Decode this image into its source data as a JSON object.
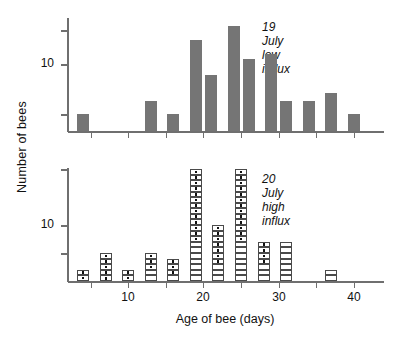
{
  "figure": {
    "ylabel": "Number of bees",
    "xlabel": "Age of bee (days)"
  },
  "panels": [
    {
      "id": "top",
      "note_line1": "19 July",
      "note_line2": "low influx"
    },
    {
      "id": "bottom",
      "note_line1": "20 July",
      "note_line2": "high influx"
    }
  ],
  "axes": {
    "x_ticklabels": [
      "10",
      "20",
      "30",
      "40"
    ],
    "x_tickvalues": [
      10,
      20,
      30,
      40
    ],
    "x_minor_tickvalues": [
      5,
      15,
      25,
      35
    ],
    "y_ticklabels": [
      "10"
    ],
    "y_tickvalues": [
      10
    ]
  },
  "chart_data": [
    {
      "type": "bar",
      "title": "19 July low influx",
      "xlabel": "Age of bee (days)",
      "ylabel": "Number of bees",
      "yscale": "log",
      "ylim": [
        1,
        45
      ],
      "xlim": [
        2,
        44
      ],
      "grid": false,
      "legend": false,
      "bar_color": "#757575",
      "x": [
        4,
        13,
        16,
        19,
        21,
        24,
        26,
        29,
        31,
        34,
        37,
        40
      ],
      "values": [
        2,
        3,
        2,
        22,
        7,
        35,
        12,
        14,
        3,
        3,
        4,
        2
      ],
      "bin_width": 1.6
    },
    {
      "type": "bar",
      "title": "20 July high influx",
      "xlabel": "Age of bee (days)",
      "ylabel": "Number of bees",
      "yscale": "linear-unit-squares",
      "ylim": [
        0,
        21
      ],
      "xlim": [
        2,
        44
      ],
      "grid": false,
      "legend": false,
      "note": "Each bar is a stack of unit squares; squares with a centre dot are marked bees, empty squares are unmarked bees.",
      "x": [
        4,
        7,
        10,
        13,
        16,
        19,
        22,
        25,
        28,
        31,
        37
      ],
      "values": [
        2,
        5,
        2,
        5,
        4,
        20,
        10,
        20,
        7,
        7,
        2
      ],
      "marked": [
        2,
        5,
        2,
        3,
        3,
        13,
        7,
        13,
        4,
        0,
        0
      ],
      "bin_width": 1.6
    }
  ]
}
